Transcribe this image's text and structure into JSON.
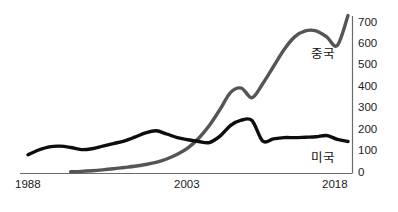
{
  "chart_data": {
    "type": "line",
    "title": "",
    "subtitle": "",
    "xlabel": "",
    "ylabel": "",
    "xlim": [
      1988,
      2018
    ],
    "ylim": [
      0,
      740
    ],
    "grid": false,
    "legend_position": "inline-right",
    "y_ticks": [
      {
        "value": 700,
        "label": "700"
      },
      {
        "value": 600,
        "label": "600"
      },
      {
        "value": 500,
        "label": "500"
      },
      {
        "value": 400,
        "label": "400"
      },
      {
        "value": 300,
        "label": "300"
      },
      {
        "value": 200,
        "label": "200"
      },
      {
        "value": 100,
        "label": "100"
      },
      {
        "value": 0,
        "label": "0"
      }
    ],
    "x_ticks": [
      {
        "value": 1988,
        "label": "1988"
      },
      {
        "value": 2003,
        "label": "2003"
      },
      {
        "value": 2018,
        "label": "2018"
      }
    ],
    "series": [
      {
        "name": "중국",
        "color": "#555555",
        "x": [
          1992,
          1993,
          1994,
          1995,
          1996,
          1997,
          1998,
          1999,
          2000,
          2001,
          2002,
          2003,
          2004,
          2005,
          2006,
          2007,
          2008,
          2009,
          2010,
          2011,
          2012,
          2013,
          2014,
          2015,
          2016,
          2017,
          2018
        ],
        "values": [
          8,
          10,
          13,
          17,
          22,
          28,
          34,
          42,
          52,
          68,
          90,
          120,
          165,
          225,
          300,
          380,
          400,
          355,
          420,
          500,
          580,
          640,
          668,
          668,
          640,
          600,
          740
        ]
      },
      {
        "name": "미국",
        "color": "#0d0d0d",
        "x": [
          1988,
          1989,
          1990,
          1991,
          1992,
          1993,
          1994,
          1995,
          1996,
          1997,
          1998,
          1999,
          2000,
          2001,
          2002,
          2003,
          2004,
          2005,
          2006,
          2007,
          2008,
          2009,
          2010,
          2011,
          2012,
          2013,
          2014,
          2015,
          2016,
          2017,
          2018
        ],
        "values": [
          88,
          110,
          125,
          128,
          122,
          112,
          116,
          128,
          140,
          152,
          170,
          190,
          200,
          185,
          168,
          158,
          150,
          145,
          175,
          225,
          250,
          248,
          152,
          162,
          168,
          168,
          170,
          172,
          178,
          160,
          150
        ]
      }
    ],
    "series_labels": [
      {
        "name": "중국"
      },
      {
        "name": "미국"
      }
    ]
  },
  "axes": {
    "y_axis_name": "y-axis",
    "x_axis_name": "x-axis"
  }
}
